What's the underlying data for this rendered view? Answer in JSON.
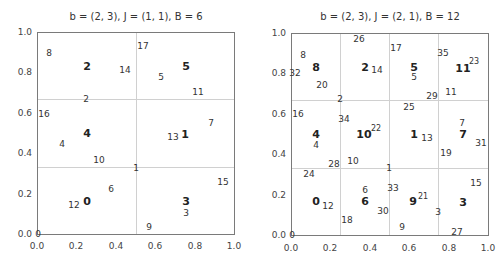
{
  "chart_data": [
    {
      "type": "scatter",
      "title": "b = (2, 3), J = (1, 1), B = 6",
      "xlabel": "",
      "ylabel": "",
      "xlim": [
        0,
        1
      ],
      "ylim": [
        0,
        1
      ],
      "xticks": [
        "0.0",
        "0.2",
        "0.4",
        "0.6",
        "0.8",
        "1.0"
      ],
      "yticks": [
        "0.0",
        "0.2",
        "0.4",
        "0.6",
        "0.8",
        "1.0"
      ],
      "grid": {
        "x": [
          0.5
        ],
        "y": [
          0.3333,
          0.6667
        ]
      },
      "bin_labels": [
        {
          "label": "0",
          "x": 0.25,
          "y": 0.167
        },
        {
          "label": "3",
          "x": 0.75,
          "y": 0.167
        },
        {
          "label": "4",
          "x": 0.25,
          "y": 0.5
        },
        {
          "label": "1",
          "x": 0.75,
          "y": 0.5
        },
        {
          "label": "2",
          "x": 0.25,
          "y": 0.833
        },
        {
          "label": "5",
          "x": 0.75,
          "y": 0.833
        }
      ],
      "points": [
        {
          "label": "0",
          "x": 0.0,
          "y": 0.0
        },
        {
          "label": "1",
          "x": 0.5,
          "y": 0.33
        },
        {
          "label": "2",
          "x": 0.25,
          "y": 0.67
        },
        {
          "label": "3",
          "x": 0.75,
          "y": 0.1
        },
        {
          "label": "4",
          "x": 0.125,
          "y": 0.44
        },
        {
          "label": "5",
          "x": 0.625,
          "y": 0.78
        },
        {
          "label": "6",
          "x": 0.375,
          "y": 0.22
        },
        {
          "label": "7",
          "x": 0.875,
          "y": 0.56
        },
        {
          "label": "8",
          "x": 0.0625,
          "y": 0.89
        },
        {
          "label": "9",
          "x": 0.5625,
          "y": 0.04
        },
        {
          "label": "10",
          "x": 0.3125,
          "y": 0.37
        },
        {
          "label": "11",
          "x": 0.8125,
          "y": 0.7
        },
        {
          "label": "12",
          "x": 0.1875,
          "y": 0.15
        },
        {
          "label": "13",
          "x": 0.6875,
          "y": 0.48
        },
        {
          "label": "14",
          "x": 0.4375,
          "y": 0.81
        },
        {
          "label": "15",
          "x": 0.9375,
          "y": 0.26
        },
        {
          "label": "16",
          "x": 0.03125,
          "y": 0.59
        },
        {
          "label": "17",
          "x": 0.53125,
          "y": 0.93
        }
      ]
    },
    {
      "type": "scatter",
      "title": "b = (2, 3), J = (2, 1), B = 12",
      "xlabel": "",
      "ylabel": "",
      "xlim": [
        0,
        1
      ],
      "ylim": [
        0,
        1
      ],
      "xticks": [
        "0.0",
        "0.2",
        "0.4",
        "0.6",
        "0.8",
        "1.0"
      ],
      "yticks": [
        "0.0",
        "0.2",
        "0.4",
        "0.6",
        "0.8",
        "1.0"
      ],
      "grid": {
        "x": [
          0.25,
          0.5,
          0.75
        ],
        "y": [
          0.3333,
          0.6667
        ]
      },
      "bin_labels": [
        {
          "label": "0",
          "x": 0.125,
          "y": 0.167
        },
        {
          "label": "6",
          "x": 0.375,
          "y": 0.167
        },
        {
          "label": "9",
          "x": 0.625,
          "y": 0.167
        },
        {
          "label": "3",
          "x": 0.875,
          "y": 0.167
        },
        {
          "label": "4",
          "x": 0.125,
          "y": 0.5
        },
        {
          "label": "10",
          "x": 0.375,
          "y": 0.5
        },
        {
          "label": "1",
          "x": 0.625,
          "y": 0.5
        },
        {
          "label": "7",
          "x": 0.875,
          "y": 0.5
        },
        {
          "label": "8",
          "x": 0.125,
          "y": 0.833
        },
        {
          "label": "2",
          "x": 0.375,
          "y": 0.833
        },
        {
          "label": "5",
          "x": 0.625,
          "y": 0.833
        },
        {
          "label": "11",
          "x": 0.875,
          "y": 0.833
        }
      ],
      "points": [
        {
          "label": "0",
          "x": 0.0,
          "y": 0.0
        },
        {
          "label": "1",
          "x": 0.5,
          "y": 0.33
        },
        {
          "label": "2",
          "x": 0.25,
          "y": 0.67
        },
        {
          "label": "3",
          "x": 0.75,
          "y": 0.11
        },
        {
          "label": "4",
          "x": 0.125,
          "y": 0.44
        },
        {
          "label": "5",
          "x": 0.625,
          "y": 0.78
        },
        {
          "label": "6",
          "x": 0.375,
          "y": 0.22
        },
        {
          "label": "7",
          "x": 0.875,
          "y": 0.56
        },
        {
          "label": "8",
          "x": 0.0625,
          "y": 0.89
        },
        {
          "label": "9",
          "x": 0.5625,
          "y": 0.04
        },
        {
          "label": "10",
          "x": 0.3125,
          "y": 0.37
        },
        {
          "label": "11",
          "x": 0.8125,
          "y": 0.7
        },
        {
          "label": "12",
          "x": 0.1875,
          "y": 0.15
        },
        {
          "label": "13",
          "x": 0.6875,
          "y": 0.48
        },
        {
          "label": "14",
          "x": 0.4375,
          "y": 0.81
        },
        {
          "label": "15",
          "x": 0.9375,
          "y": 0.26
        },
        {
          "label": "16",
          "x": 0.03125,
          "y": 0.59
        },
        {
          "label": "17",
          "x": 0.53125,
          "y": 0.93
        },
        {
          "label": "18",
          "x": 0.28125,
          "y": 0.07
        },
        {
          "label": "19",
          "x": 0.78125,
          "y": 0.41
        },
        {
          "label": "20",
          "x": 0.15625,
          "y": 0.74
        },
        {
          "label": "21",
          "x": 0.65625,
          "y": 0.19
        },
        {
          "label": "22",
          "x": 0.40625,
          "y": 0.52
        },
        {
          "label": "23",
          "x": 0.90625,
          "y": 0.85
        },
        {
          "label": "24",
          "x": 0.09375,
          "y": 0.3
        },
        {
          "label": "25",
          "x": 0.59375,
          "y": 0.63
        },
        {
          "label": "26",
          "x": 0.34375,
          "y": 0.96
        },
        {
          "label": "27",
          "x": 0.84375,
          "y": 0.01
        },
        {
          "label": "28",
          "x": 0.21875,
          "y": 0.35
        },
        {
          "label": "29",
          "x": 0.71875,
          "y": 0.68
        },
        {
          "label": "30",
          "x": 0.46875,
          "y": 0.12
        },
        {
          "label": "31",
          "x": 0.96875,
          "y": 0.46
        },
        {
          "label": "32",
          "x": 0.015625,
          "y": 0.79
        },
        {
          "label": "33",
          "x": 0.515625,
          "y": 0.23
        },
        {
          "label": "34",
          "x": 0.265625,
          "y": 0.57
        },
        {
          "label": "35",
          "x": 0.765625,
          "y": 0.9
        }
      ]
    }
  ],
  "left": {
    "title": "b = (2, 3), J = (1, 1), B = 6",
    "labels": [
      {
        "t": "8",
        "c": "small",
        "x": 49,
        "y": 53
      },
      {
        "t": "2",
        "c": "bold",
        "x": 87,
        "y": 66
      },
      {
        "t": "14",
        "c": "small",
        "x": 125,
        "y": 70
      },
      {
        "t": "17",
        "c": "small",
        "x": 143,
        "y": 46
      },
      {
        "t": "5",
        "c": "small",
        "x": 161,
        "y": 77
      },
      {
        "t": "5",
        "c": "bold",
        "x": 186,
        "y": 66
      },
      {
        "t": "11",
        "c": "small",
        "x": 198,
        "y": 92
      },
      {
        "t": "2",
        "c": "small",
        "x": 86,
        "y": 99
      },
      {
        "t": "16",
        "c": "small",
        "x": 44,
        "y": 114
      },
      {
        "t": "7",
        "c": "small",
        "x": 211,
        "y": 123
      },
      {
        "t": "4",
        "c": "bold",
        "x": 87,
        "y": 133
      },
      {
        "t": "4",
        "c": "small",
        "x": 62,
        "y": 144
      },
      {
        "t": "13",
        "c": "small",
        "x": 173,
        "y": 137
      },
      {
        "t": "1",
        "c": "bold",
        "x": 185,
        "y": 134
      },
      {
        "t": "10",
        "c": "small",
        "x": 99,
        "y": 160
      },
      {
        "t": "1",
        "c": "small",
        "x": 136,
        "y": 168
      },
      {
        "t": "15",
        "c": "small",
        "x": 223,
        "y": 182
      },
      {
        "t": "6",
        "c": "small",
        "x": 111,
        "y": 189
      },
      {
        "t": "0",
        "c": "bold",
        "x": 87,
        "y": 201
      },
      {
        "t": "12",
        "c": "small",
        "x": 74,
        "y": 205
      },
      {
        "t": "3",
        "c": "bold",
        "x": 186,
        "y": 201
      },
      {
        "t": "3",
        "c": "small",
        "x": 186,
        "y": 213
      },
      {
        "t": "9",
        "c": "small",
        "x": 149,
        "y": 227
      },
      {
        "t": "0",
        "c": "small",
        "x": 38,
        "y": 234
      }
    ]
  },
  "right": {
    "title": "b = (2, 3), J = (2, 1), B = 12",
    "labels": [
      {
        "t": "26",
        "c": "small",
        "x": 359,
        "y": 39
      },
      {
        "t": "17",
        "c": "small",
        "x": 396,
        "y": 48
      },
      {
        "t": "35",
        "c": "small",
        "x": 443,
        "y": 53
      },
      {
        "t": "8",
        "c": "small",
        "x": 303,
        "y": 55
      },
      {
        "t": "8",
        "c": "bold",
        "x": 316,
        "y": 67
      },
      {
        "t": "32",
        "c": "small",
        "x": 295,
        "y": 73
      },
      {
        "t": "2",
        "c": "bold",
        "x": 365,
        "y": 67
      },
      {
        "t": "14",
        "c": "small",
        "x": 377,
        "y": 70
      },
      {
        "t": "5",
        "c": "bold",
        "x": 414,
        "y": 67
      },
      {
        "t": "5",
        "c": "small",
        "x": 414,
        "y": 77
      },
      {
        "t": "11",
        "c": "bold",
        "x": 463,
        "y": 68
      },
      {
        "t": "23",
        "c": "sup",
        "x": 474,
        "y": 62
      },
      {
        "t": "20",
        "c": "small",
        "x": 322,
        "y": 85
      },
      {
        "t": "29",
        "c": "small",
        "x": 432,
        "y": 96
      },
      {
        "t": "11",
        "c": "small",
        "x": 451,
        "y": 92
      },
      {
        "t": "2",
        "c": "small",
        "x": 340,
        "y": 99
      },
      {
        "t": "25",
        "c": "small",
        "x": 409,
        "y": 107
      },
      {
        "t": "16",
        "c": "small",
        "x": 298,
        "y": 114
      },
      {
        "t": "34",
        "c": "small",
        "x": 344,
        "y": 119
      },
      {
        "t": "7",
        "c": "small",
        "x": 462,
        "y": 123
      },
      {
        "t": "4",
        "c": "bold",
        "x": 316,
        "y": 134
      },
      {
        "t": "4",
        "c": "small",
        "x": 316,
        "y": 145
      },
      {
        "t": "10",
        "c": "bold",
        "x": 364,
        "y": 134
      },
      {
        "t": "22",
        "c": "sup",
        "x": 376,
        "y": 129
      },
      {
        "t": "1",
        "c": "bold",
        "x": 414,
        "y": 134
      },
      {
        "t": "13",
        "c": "small",
        "x": 427,
        "y": 138
      },
      {
        "t": "7",
        "c": "bold",
        "x": 463,
        "y": 134
      },
      {
        "t": "31",
        "c": "small",
        "x": 481,
        "y": 143
      },
      {
        "t": "19",
        "c": "small",
        "x": 446,
        "y": 153
      },
      {
        "t": "28",
        "c": "small",
        "x": 334,
        "y": 164
      },
      {
        "t": "10",
        "c": "small",
        "x": 353,
        "y": 161
      },
      {
        "t": "24",
        "c": "small",
        "x": 309,
        "y": 174
      },
      {
        "t": "1",
        "c": "small",
        "x": 389,
        "y": 168
      },
      {
        "t": "15",
        "c": "small",
        "x": 476,
        "y": 183
      },
      {
        "t": "6",
        "c": "small",
        "x": 365,
        "y": 190
      },
      {
        "t": "33",
        "c": "small",
        "x": 393,
        "y": 188
      },
      {
        "t": "0",
        "c": "bold",
        "x": 316,
        "y": 201
      },
      {
        "t": "12",
        "c": "small",
        "x": 328,
        "y": 206
      },
      {
        "t": "6",
        "c": "bold",
        "x": 365,
        "y": 201
      },
      {
        "t": "9",
        "c": "bold",
        "x": 413,
        "y": 201
      },
      {
        "t": "21",
        "c": "sup",
        "x": 423,
        "y": 197
      },
      {
        "t": "3",
        "c": "bold",
        "x": 463,
        "y": 202
      },
      {
        "t": "30",
        "c": "small",
        "x": 383,
        "y": 211
      },
      {
        "t": "3",
        "c": "small",
        "x": 438,
        "y": 212
      },
      {
        "t": "18",
        "c": "small",
        "x": 347,
        "y": 220
      },
      {
        "t": "9",
        "c": "small",
        "x": 402,
        "y": 227
      },
      {
        "t": "27",
        "c": "small",
        "x": 457,
        "y": 232
      },
      {
        "t": "0",
        "c": "small",
        "x": 292,
        "y": 235
      }
    ]
  },
  "ticks": [
    "0.0",
    "0.2",
    "0.4",
    "0.6",
    "0.8",
    "1.0"
  ],
  "colors": {
    "frame": "#7a7a7a",
    "grid": "#d0d0d0",
    "text": "#333333"
  }
}
